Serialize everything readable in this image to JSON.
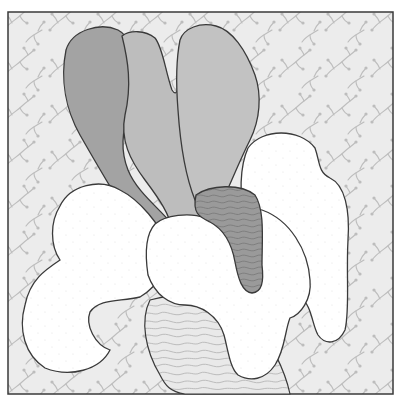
{
  "artwork": {
    "style": "abstract coloring-page illustration",
    "frame": {
      "x": 8,
      "y": 12,
      "width": 385,
      "height": 382
    },
    "colors": {
      "page": "#ffffff",
      "background_fill": "#ececec",
      "background_pattern": "#bdbdbd",
      "outline": "#3a3a3a",
      "shape_dark": "#a3a3a3",
      "shape_mid": "#bdbdbd",
      "shape_light": "#c2c2c2",
      "shape_textured": "#9a9a9a",
      "shape_white": "#ffffff",
      "shape_contour_light": "#e6e6e6"
    },
    "shapes": [
      {
        "name": "dark-left-petal",
        "fill": "shape_dark"
      },
      {
        "name": "mid-center-petal",
        "fill": "shape_mid"
      },
      {
        "name": "light-right-petal",
        "fill": "shape_light"
      },
      {
        "name": "textured-stem",
        "fill": "shape_textured"
      },
      {
        "name": "white-left-cloud",
        "fill": "shape_white"
      },
      {
        "name": "white-right-cloud",
        "fill": "shape_white"
      },
      {
        "name": "white-center-cloud",
        "fill": "shape_white"
      },
      {
        "name": "contour-bottom-shape",
        "fill": "shape_contour_light"
      }
    ]
  }
}
